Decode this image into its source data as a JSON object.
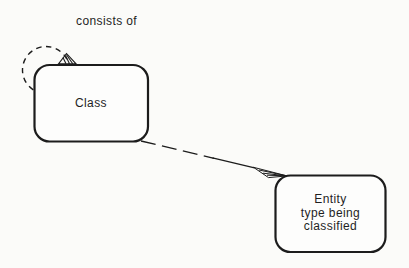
{
  "diagram": {
    "relation_label": "consists of",
    "class_box": {
      "label": "Class"
    },
    "entity_box": {
      "label": "Entity\ntype being\nclassified"
    },
    "colors": {
      "stroke": "#1c1c1c",
      "box_fill": "#fdfdfc",
      "background": "#fbfbf9",
      "text": "#1f1f1f"
    }
  }
}
